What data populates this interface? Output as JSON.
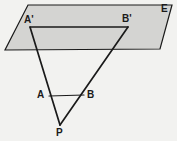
{
  "figure": {
    "kind": "geometry-diagram",
    "background_color": "#f2f2f0",
    "stroke_color": "#1a1a1a",
    "plane_fill_color": "#d4d4d2",
    "canvas": {
      "width": 177,
      "height": 141
    }
  },
  "plane": {
    "name": "plane-E",
    "label": "E",
    "label_x": 161,
    "label_y": 4,
    "outline_points": "28,5 172,5 160,49 5,50",
    "fill": "#d4d4d2",
    "stroke": "#1a1a1a",
    "stroke_width": 1.2
  },
  "points": [
    {
      "id": "A_prime",
      "label": "A'",
      "x": 30,
      "y": 27,
      "label_x": 24,
      "label_y": 15
    },
    {
      "id": "B_prime",
      "label": "B'",
      "x": 128,
      "y": 27,
      "label_x": 122,
      "label_y": 14
    },
    {
      "id": "A",
      "label": "A",
      "x": 49,
      "y": 96,
      "label_x": 37,
      "label_y": 90
    },
    {
      "id": "B",
      "label": "B",
      "x": 84,
      "y": 95,
      "label_x": 87,
      "label_y": 90
    },
    {
      "id": "P",
      "label": "P",
      "x": 60,
      "y": 125,
      "label_x": 56,
      "label_y": 128
    }
  ],
  "segments": [
    {
      "id": "seg-A-prime-B-prime",
      "from": "A_prime",
      "to": "B_prime",
      "x1": 30,
      "y1": 27,
      "x2": 128,
      "y2": 27,
      "stroke_width": 1.4
    },
    {
      "id": "seg-A-prime-P",
      "from": "A_prime",
      "to": "P",
      "x1": 30,
      "y1": 27,
      "x2": 60,
      "y2": 125,
      "stroke_width": 1.6
    },
    {
      "id": "seg-B-prime-P",
      "from": "B_prime",
      "to": "P",
      "x1": 128,
      "y1": 27,
      "x2": 60,
      "y2": 125,
      "stroke_width": 1.6
    },
    {
      "id": "seg-A-B",
      "from": "A",
      "to": "B",
      "x1": 49,
      "y1": 96,
      "x2": 84,
      "y2": 95,
      "stroke_width": 1.2
    }
  ]
}
